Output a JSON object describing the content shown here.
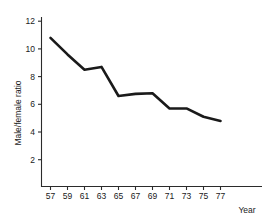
{
  "chart_data": {
    "type": "line",
    "title": "",
    "xlabel": "Year",
    "ylabel": "Male/female ratio",
    "categories": [
      "57",
      "59",
      "61",
      "63",
      "65",
      "67",
      "69",
      "71",
      "73",
      "75",
      "77"
    ],
    "x": [
      57,
      59,
      61,
      63,
      65,
      67,
      69,
      71,
      73,
      75,
      77
    ],
    "values": [
      10.8,
      9.6,
      8.5,
      8.7,
      6.6,
      6.75,
      6.8,
      5.7,
      5.7,
      5.1,
      4.8
    ],
    "series": [
      {
        "name": "Male/female ratio",
        "values": [
          10.8,
          9.6,
          8.5,
          8.7,
          6.6,
          6.75,
          6.8,
          5.7,
          5.7,
          5.1,
          4.8
        ],
        "color": "#1a1a1a"
      }
    ],
    "ytick_labels": [
      "2",
      "4",
      "6",
      "8",
      "10",
      "12"
    ],
    "ytick_values": [
      2,
      4,
      6,
      8,
      10,
      12
    ],
    "xtick_labels": [
      "57",
      "59",
      "61",
      "63",
      "65",
      "67",
      "69",
      "71",
      "73",
      "75",
      "77"
    ],
    "ylim": [
      0,
      12.8
    ],
    "xlim": [
      56,
      78.5
    ],
    "grid": false,
    "legend": false,
    "line_color": "#1a1a1a",
    "axis_color": "#2b2b2b",
    "background": "#ffffff"
  }
}
